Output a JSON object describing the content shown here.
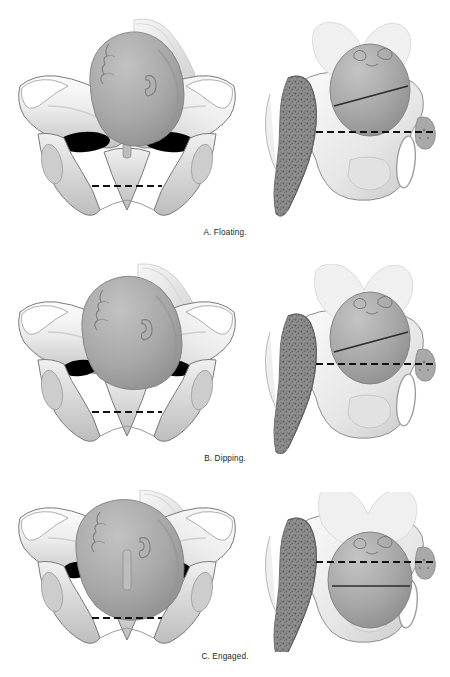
{
  "figure": {
    "background_color": "#ffffff",
    "panels": [
      {
        "id": "a",
        "letter": "A",
        "caption": "A. Floating.",
        "station_label": "Floating",
        "description": "Fetal head is entirely above the pelvic inlet; biparietal diameter well above the ischial spines.",
        "bpd_relative_to_spines": "above",
        "views": [
          {
            "id": "a-anterior",
            "name": "anterior-pelvic-view",
            "orientation": "anterior",
            "label": "Anterior view of bony pelvis with fetal head floating above the inlet"
          },
          {
            "id": "a-lateral",
            "name": "lateral-pelvic-view",
            "orientation": "lateral-hemisected",
            "label": "Lateral hemisected pelvis showing biparietal diameter above the ischial spine line"
          }
        ]
      },
      {
        "id": "b",
        "letter": "B",
        "caption": "B. Dipping.",
        "station_label": "Dipping",
        "description": "Fetal head dips into the pelvic inlet; biparietal diameter approaches but has not passed the ischial spines.",
        "bpd_relative_to_spines": "at-or-just-above",
        "views": [
          {
            "id": "b-anterior",
            "name": "anterior-pelvic-view",
            "orientation": "anterior",
            "label": "Anterior view of bony pelvis with fetal head dipping into the inlet"
          },
          {
            "id": "b-lateral",
            "name": "lateral-pelvic-view",
            "orientation": "lateral-hemisected",
            "label": "Lateral hemisected pelvis showing biparietal diameter level with the ischial spine line"
          }
        ]
      },
      {
        "id": "c",
        "letter": "C",
        "caption": "C. Engaged.",
        "station_label": "Engaged",
        "description": "Fetal head is engaged; biparietal diameter has passed below the level of the ischial spines.",
        "bpd_relative_to_spines": "below",
        "views": [
          {
            "id": "c-anterior",
            "name": "anterior-pelvic-view",
            "orientation": "anterior",
            "label": "Anterior view of bony pelvis with fetal head engaged in the inlet"
          },
          {
            "id": "c-lateral",
            "name": "lateral-pelvic-view",
            "orientation": "lateral-hemisected",
            "label": "Lateral hemisected pelvis showing biparietal diameter below the ischial spine line"
          }
        ]
      }
    ],
    "annotations": {
      "ischial_spine_line": {
        "name": "ischial-spine-dashed-line",
        "style": "dashed",
        "color": "#111111",
        "dash_pattern": "7 4"
      },
      "biparietal_diameter_line": {
        "name": "biparietal-diameter-line",
        "style": "solid",
        "color": "#2b2b2b"
      }
    },
    "colors": {
      "bone_light": "#f2f2f2",
      "bone_mid": "#d9d9d9",
      "bone_shadow": "#b3b3b3",
      "bone_outline": "#6e6e6e",
      "fetal_head": "#a8a8a8",
      "fetal_head_shadow": "#8c8c8c",
      "cancellous_bone": "#8a8a8a",
      "foramen": "#000000",
      "caption_text": "#231f20"
    },
    "watermark": ""
  }
}
